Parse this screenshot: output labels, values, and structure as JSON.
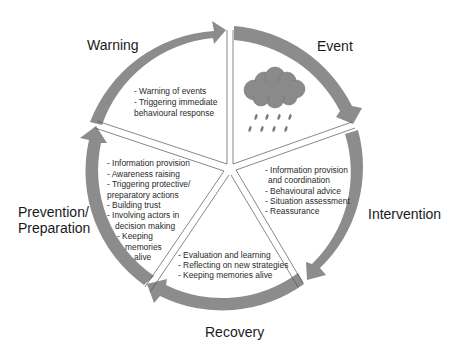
{
  "colors": {
    "arrow": "#8c8c8c",
    "cloud": "#8a8a8a",
    "rain": "#7a7a7a",
    "divider": "#555555",
    "text": "#1a1a1a"
  },
  "phases": [
    {
      "id": "warning",
      "label_lines": [
        "Warning"
      ],
      "bullets": [
        "- Warning of events",
        "- Triggering immediate",
        "behavioural response"
      ]
    },
    {
      "id": "event",
      "label_lines": [
        "Event"
      ],
      "icon": "rain-cloud-icon",
      "bullets": []
    },
    {
      "id": "intervention",
      "label_lines": [
        "Intervention"
      ],
      "bullets": [
        "- Information provision",
        "and coordination",
        "- Behavioural advice",
        "- Situation assessment",
        "- Reassurance"
      ]
    },
    {
      "id": "recovery",
      "label_lines": [
        "Recovery"
      ],
      "bullets": [
        "- Evaluation and learning",
        "- Reflecting on new strategies",
        "- Keeping memories alive"
      ]
    },
    {
      "id": "prevention",
      "label_lines": [
        "Prevention/",
        "Preparation"
      ],
      "bullets": [
        "- Information provision",
        "- Awareness raising",
        "- Triggering protective/",
        "preparatory actions",
        "- Building trust",
        "- Involving actors in",
        "decision making",
        "- Keeping",
        "memories",
        "alive"
      ]
    }
  ]
}
